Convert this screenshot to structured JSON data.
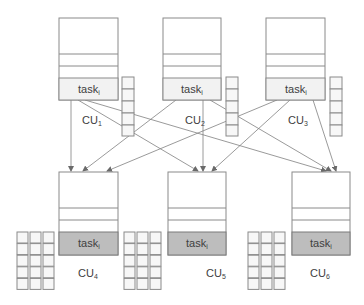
{
  "diagram": {
    "type": "compute-unit task distribution",
    "colors": {
      "border": "#8a8a8a",
      "task_top_fill": "#f2f2f2",
      "task_bottom_fill": "#bdbdbd",
      "edge": "#808080"
    },
    "top_units": [
      {
        "id": "CU1",
        "label": "CU",
        "sub": "1",
        "task_label": "task",
        "task_sub": "i"
      },
      {
        "id": "CU2",
        "label": "CU",
        "sub": "2",
        "task_label": "task",
        "task_sub": "i"
      },
      {
        "id": "CU3",
        "label": "CU",
        "sub": "3",
        "task_label": "task",
        "task_sub": "i"
      }
    ],
    "bottom_units": [
      {
        "id": "CU4",
        "label": "CU",
        "sub": "4",
        "task_label": "task",
        "task_sub": "i"
      },
      {
        "id": "CU5",
        "label": "CU",
        "sub": "5",
        "task_label": "task",
        "task_sub": "i"
      },
      {
        "id": "CU6",
        "label": "CU",
        "sub": "6",
        "task_label": "task",
        "task_sub": "i"
      }
    ],
    "edges": [
      {
        "from": "CU1",
        "to": "CU4"
      },
      {
        "from": "CU1",
        "to": "CU5"
      },
      {
        "from": "CU1",
        "to": "CU6"
      },
      {
        "from": "CU2",
        "to": "CU4"
      },
      {
        "from": "CU2",
        "to": "CU5"
      },
      {
        "from": "CU2",
        "to": "CU6"
      },
      {
        "from": "CU3",
        "to": "CU4"
      },
      {
        "from": "CU3",
        "to": "CU5"
      },
      {
        "from": "CU3",
        "to": "CU6"
      }
    ]
  }
}
